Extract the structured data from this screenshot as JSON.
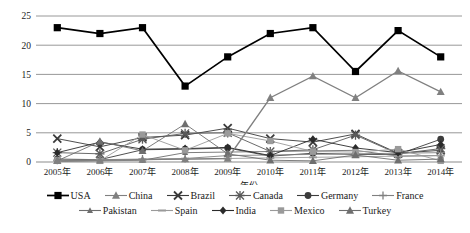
{
  "chart_data": {
    "type": "line",
    "title": "",
    "xlabel": "年份",
    "ylabel": "",
    "ylim": [
      0,
      25
    ],
    "yticks": [
      0,
      5,
      10,
      15,
      20,
      25
    ],
    "grid": true,
    "legend_position": "bottom",
    "categories": [
      "2005年",
      "2006年",
      "2007年",
      "2008年",
      "2009年",
      "2010年",
      "2011年",
      "2012年",
      "2013年",
      "2014年"
    ],
    "series": [
      {
        "name": "USA",
        "marker": "square",
        "color": "#000000",
        "values": [
          23.0,
          22.0,
          23.0,
          13.0,
          18.0,
          22.0,
          23.0,
          15.5,
          22.5,
          18.0
        ]
      },
      {
        "name": "China",
        "marker": "triangle",
        "color": "#808080",
        "values": [
          0.2,
          0.3,
          0.4,
          0.5,
          0.6,
          11.0,
          14.7,
          11.0,
          15.6,
          12.0
        ]
      },
      {
        "name": "Brazil",
        "marker": "x",
        "color": "#3a3a3a",
        "values": [
          4.0,
          2.6,
          4.2,
          4.6,
          5.8,
          4.0,
          3.4,
          4.8,
          1.5,
          2.0
        ]
      },
      {
        "name": "Canada",
        "marker": "star",
        "color": "#5a5a5a",
        "values": [
          1.6,
          1.4,
          3.9,
          4.9,
          5.0,
          1.8,
          2.1,
          4.6,
          1.4,
          2.3
        ]
      },
      {
        "name": "Germany",
        "marker": "circle",
        "color": "#3c3c3c",
        "values": [
          0.5,
          0.4,
          2.1,
          2.2,
          2.4,
          1.0,
          1.5,
          1.3,
          1.3,
          3.9
        ]
      },
      {
        "name": "France",
        "marker": "plus",
        "color": "#808080",
        "values": [
          0.3,
          0.4,
          0.5,
          0.6,
          1.1,
          1.2,
          1.3,
          1.4,
          1.5,
          1.6
        ]
      },
      {
        "name": "Pakistan",
        "marker": "smalltri",
        "color": "#6e6e6e",
        "values": [
          0.1,
          0.2,
          0.3,
          1.6,
          1.7,
          1.8,
          1.9,
          2.0,
          1.0,
          1.1
        ]
      },
      {
        "name": "Spain",
        "marker": "dash",
        "color": "#9a9a9a",
        "values": [
          0.2,
          0.3,
          0.4,
          0.5,
          0.6,
          0.7,
          0.8,
          0.9,
          1.0,
          1.1
        ]
      },
      {
        "name": "India",
        "marker": "diamond",
        "color": "#2b2b2b",
        "values": [
          1.6,
          3.4,
          2.2,
          2.3,
          2.5,
          1.1,
          3.9,
          2.4,
          1.6,
          3.0
        ]
      },
      {
        "name": "Mexico",
        "marker": "fsquare",
        "color": "#9a9a9a",
        "values": [
          0.3,
          0.2,
          4.7,
          2.0,
          4.9,
          3.6,
          1.8,
          1.7,
          2.2,
          0.2
        ]
      },
      {
        "name": "Turkey",
        "marker": "triangle",
        "color": "#6e6e6e",
        "values": [
          0.2,
          3.5,
          1.9,
          6.5,
          1.4,
          0.3,
          0.2,
          1.2,
          0.3,
          0.5
        ]
      }
    ]
  },
  "legend": {
    "rows": [
      [
        "USA",
        "China",
        "Brazil",
        "Canada",
        "Germany",
        "France"
      ],
      [
        "Pakistan",
        "Spain",
        "India",
        "Mexico",
        "Turkey"
      ]
    ]
  }
}
